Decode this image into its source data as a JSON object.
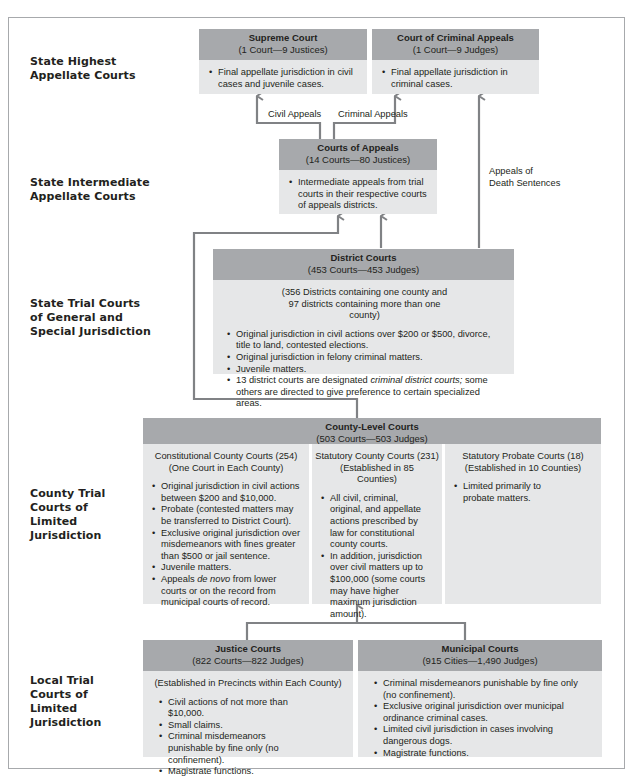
{
  "levels": [
    {
      "label": "State Highest Appellate Courts"
    },
    {
      "label": "State Intermediate Appellate Courts"
    },
    {
      "label": "State Trial Courts of General and Special Jurisdiction"
    },
    {
      "label": "County Trial Courts of Limited Jurisdiction"
    },
    {
      "label": "Local Trial Courts of Limited Jurisdiction"
    }
  ],
  "level_lines": {
    "highest": [
      "State Highest",
      "Appellate Courts"
    ],
    "intermediate": [
      "State Intermediate",
      "Appellate Courts"
    ],
    "trial": [
      "State Trial Courts",
      "of General and",
      "Special Jurisdiction"
    ],
    "county": [
      "County Trial",
      "Courts of",
      "Limited",
      "Jurisdiction"
    ],
    "local": [
      "Local Trial",
      "Courts of",
      "Limited",
      "Jurisdiction"
    ]
  },
  "courts": {
    "supreme": {
      "name": "Supreme Court",
      "count": "(1 Court—9 Justices)",
      "items": [
        "Final appellate jurisdiction in civil cases and juvenile cases."
      ]
    },
    "criminal_appeals": {
      "name": "Court of Criminal Appeals",
      "count": "(1 Court—9 Judges)",
      "items": [
        "Final appellate jurisdiction in criminal cases."
      ]
    },
    "appeals": {
      "name": "Courts of Appeals",
      "count": "(14 Courts—80 Justices)",
      "items": [
        "Intermediate appeals from trial courts in their respective courts of appeals districts."
      ]
    },
    "district": {
      "name": "District Courts",
      "count": "(453 Courts—453 Judges)",
      "note": "(356 Districts containing one county and 97 districts containing more than one county)",
      "items": [
        "Original jurisdiction in civil actions over $200 or $500, divorce, title to land, contested elections.",
        "Original jurisdiction in felony criminal matters.",
        "Juvenile matters."
      ],
      "item4_pre": "13 district courts are designated ",
      "item4_em": "criminal district courts;",
      "item4_post": " some others are directed to give preference to certain specialized areas."
    },
    "county_level": {
      "name": "County-Level Courts",
      "count": "(503 Courts—503 Judges)",
      "constitutional": {
        "title": "Constitutional County Courts (254)",
        "subtitle": "(One Court in Each County)",
        "items": [
          "Original jurisdiction in civil actions between $200 and $10,000.",
          "Probate (contested matters may be transferred to District Court).",
          "Exclusive original jurisdiction over misdemeanors with fines greater than $500 or jail sentence.",
          "Juvenile matters."
        ],
        "item5_pre": "Appeals ",
        "item5_em": "de novo",
        "item5_post": " from lower courts or on the record from municipal courts of record."
      },
      "statutory": {
        "title": "Statutory County Courts (231)",
        "subtitle": "(Established in 85 Counties)",
        "items": [
          "All civil, criminal, original, and appellate actions prescribed by law for constitutional county courts.",
          "In addition, jurisdiction over civil matters up to $100,000 (some courts may have higher maximum jurisdiction amount)."
        ]
      },
      "probate": {
        "title": "Statutory Probate Courts (18)",
        "subtitle": "(Established in 10 Counties)",
        "items": [
          "Limited primarily to probate matters."
        ]
      }
    },
    "justice": {
      "name": "Justice Courts",
      "count": "(822 Courts—822 Judges)",
      "note": "(Established in Precincts within Each County)",
      "items": [
        "Civil actions of not more than $10,000.",
        "Small claims.",
        "Criminal misdemeanors punishable by fine only (no confinement).",
        "Magistrate functions."
      ]
    },
    "municipal": {
      "name": "Municipal Courts",
      "count": "(915 Cities—1,490 Judges)",
      "items": [
        "Criminal misdemeanors punishable by fine only (no confinement).",
        "Exclusive original jurisdiction over municipal ordinance criminal cases.",
        "Limited civil jurisdiction in cases involving dangerous dogs.",
        "Magistrate functions."
      ]
    }
  },
  "arrows": {
    "civil_appeals": "Civil Appeals",
    "criminal_appeals": "Criminal Appeals",
    "death_line1": "Appeals of",
    "death_line2": "Death Sentences"
  },
  "colors": {
    "header_fill": "#a7a9ac",
    "body_fill": "#e6e7e8",
    "connector": "#808285",
    "frame": "#a7a9ac"
  }
}
